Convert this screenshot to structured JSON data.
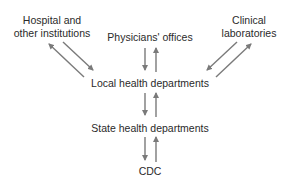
{
  "diagram": {
    "nodes": {
      "hospital": {
        "line1": "Hospital and",
        "line2": "other institutions"
      },
      "physicians": {
        "label": "Physicians' offices"
      },
      "clinical": {
        "line1": "Clinical",
        "line2": "laboratories"
      },
      "local": {
        "label": "Local health departments"
      },
      "state": {
        "label": "State health departments"
      },
      "cdc": {
        "label": "CDC"
      }
    },
    "edges": [
      {
        "from": "hospital",
        "to": "local",
        "bidirectional": true
      },
      {
        "from": "physicians",
        "to": "local",
        "bidirectional": true
      },
      {
        "from": "clinical",
        "to": "local",
        "bidirectional": true
      },
      {
        "from": "local",
        "to": "state",
        "bidirectional": true
      },
      {
        "from": "state",
        "to": "cdc",
        "bidirectional": true
      }
    ],
    "colors": {
      "arrow": "#7a7a7a",
      "text": "#2a2a2a",
      "background": "#ffffff"
    }
  }
}
